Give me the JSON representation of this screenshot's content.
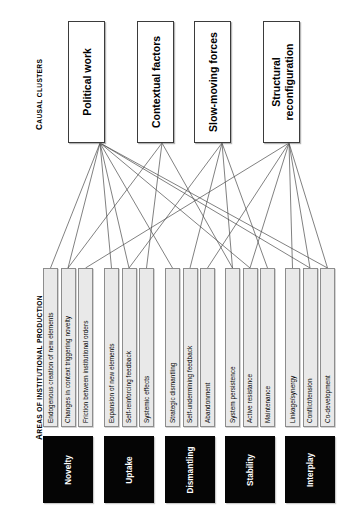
{
  "headers": {
    "clusters": {
      "first": "C",
      "rest": "AUSAL CLUSTERS"
    },
    "areas": {
      "first": "A",
      "rest": "REAS OF INSTITUTIONAL PRODUCTION"
    }
  },
  "colors": {
    "box_fill": "#ffffff",
    "box_border": "#3b3b3b",
    "item_fill": "#e9e9e9",
    "item_border": "#8d8d8d",
    "area_fill": "#050505",
    "area_text": "#ffffff",
    "link_line": "#4a4a4a",
    "background": "#ffffff"
  },
  "clusters": [
    {
      "id": "political-work",
      "label": "Political work"
    },
    {
      "id": "contextual-factors",
      "label": "Contextual factors"
    },
    {
      "id": "slow-moving-forces",
      "label": "Slow-moving forces"
    },
    {
      "id": "structural-reconfiguration",
      "label": "Structural\nreconfiguration"
    }
  ],
  "areas": [
    {
      "id": "novelty",
      "label": "Novelty",
      "items": [
        {
          "id": "endogenous-creation-of-new-elements",
          "label": "Endogenous creation of new elements"
        },
        {
          "id": "changes-in-context-triggering-novelty",
          "label": "Changes in context triggering novelty"
        },
        {
          "id": "friction-between-institutional-orders",
          "label": "Friction between institutional orders"
        }
      ]
    },
    {
      "id": "uptake",
      "label": "Uptake",
      "items": [
        {
          "id": "expansion-of-new-elements",
          "label": "Expansion of new elements"
        },
        {
          "id": "self-reinforcing-feedback",
          "label": "Self-reinforcing feedback"
        },
        {
          "id": "systemic-effects",
          "label": "Systemic effects"
        }
      ]
    },
    {
      "id": "dismantling",
      "label": "Dismantling",
      "items": [
        {
          "id": "strategic-dismantling",
          "label": "Strategic dismantling"
        },
        {
          "id": "self-undermining-feedback",
          "label": "Self-undermining feedback"
        },
        {
          "id": "abandonment",
          "label": "Abandonment"
        }
      ]
    },
    {
      "id": "stability",
      "label": "Stability",
      "items": [
        {
          "id": "system-persistence",
          "label": "System persistence"
        },
        {
          "id": "active-resistance",
          "label": "Active resistance"
        },
        {
          "id": "maintenance",
          "label": "Maintenance"
        }
      ]
    },
    {
      "id": "interplay",
      "label": "Interplay",
      "items": [
        {
          "id": "linkage-synergy",
          "label": "Linkage/synergy"
        },
        {
          "id": "conflict-tension",
          "label": "Conflict/tension"
        },
        {
          "id": "co-development",
          "label": "Co-development"
        }
      ]
    }
  ],
  "layout": {
    "cluster_boxes": [
      {
        "x": 68,
        "y": 21,
        "w": 37,
        "h": 122,
        "anchor_x": 100,
        "anchor_y": 143
      },
      {
        "x": 137,
        "y": 21,
        "w": 37,
        "h": 122,
        "anchor_x": 162,
        "anchor_y": 143
      },
      {
        "x": 194,
        "y": 21,
        "w": 37,
        "h": 122,
        "anchor_x": 222,
        "anchor_y": 143
      },
      {
        "x": 263,
        "y": 21,
        "w": 37,
        "h": 122,
        "anchor_x": 289,
        "anchor_y": 143
      }
    ],
    "item_row": {
      "y": 268,
      "h": 159,
      "w": 15
    },
    "area_row": {
      "y": 436,
      "h": 67,
      "w": 50
    },
    "group_x": [
      43,
      104,
      165,
      225,
      285
    ],
    "item_gap": 2.5
  },
  "links": [
    {
      "from": 0,
      "to": "novelty.0"
    },
    {
      "from": 0,
      "to": "novelty.1"
    },
    {
      "from": 0,
      "to": "uptake.0"
    },
    {
      "from": 0,
      "to": "uptake.1"
    },
    {
      "from": 0,
      "to": "dismantling.0"
    },
    {
      "from": 0,
      "to": "stability.1"
    },
    {
      "from": 0,
      "to": "interplay.1"
    },
    {
      "from": 0,
      "to": "interplay.2"
    },
    {
      "from": 1,
      "to": "novelty.1"
    },
    {
      "from": 1,
      "to": "uptake.2"
    },
    {
      "from": 1,
      "to": "stability.0"
    },
    {
      "from": 2,
      "to": "uptake.1"
    },
    {
      "from": 2,
      "to": "dismantling.1"
    },
    {
      "from": 2,
      "to": "stability.0"
    },
    {
      "from": 2,
      "to": "stability.2"
    },
    {
      "from": 3,
      "to": "novelty.2"
    },
    {
      "from": 3,
      "to": "dismantling.2"
    },
    {
      "from": 3,
      "to": "stability.1"
    },
    {
      "from": 3,
      "to": "interplay.0"
    },
    {
      "from": 3,
      "to": "interplay.1"
    },
    {
      "from": 3,
      "to": "interplay.2"
    }
  ]
}
